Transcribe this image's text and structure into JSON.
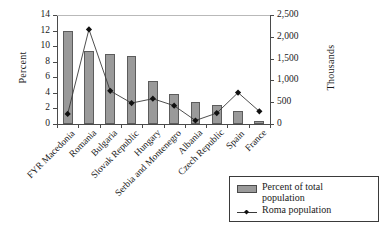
{
  "chart_data": {
    "type": "bar",
    "title": "",
    "xlabel": "",
    "ylabel": "Percent",
    "y2label": "Thousands",
    "ylim": [
      0,
      14
    ],
    "y2lim": [
      0,
      2500
    ],
    "grid": false,
    "legend_position": "bottom-right",
    "categories": [
      "FYR Macedonia",
      "Romania",
      "Bulgaria",
      "Slovak Republic",
      "Hungary",
      "Serbia and Montenegro",
      "Albania",
      "Czech Republic",
      "Spain",
      "France"
    ],
    "yticks": [
      "0",
      "2",
      "4",
      "6",
      "8",
      "10",
      "12",
      "14"
    ],
    "y2ticks": [
      "0",
      "500",
      "1,000",
      "1,500",
      "2,000",
      "2,500"
    ],
    "series": [
      {
        "name": "Percent of total population",
        "type": "bar",
        "axis": "left",
        "unit": "percent",
        "color": "#9a9a9a",
        "values": [
          12.0,
          9.4,
          9.0,
          8.8,
          5.5,
          3.9,
          2.8,
          2.5,
          1.65,
          0.35
        ]
      },
      {
        "name": "Roma population",
        "type": "line",
        "axis": "right",
        "unit": "thousands",
        "color": "#3a3a3a",
        "marker": "diamond",
        "values": [
          230,
          2170,
          760,
          480,
          580,
          420,
          80,
          250,
          720,
          290
        ]
      }
    ]
  },
  "legend": {
    "items": [
      {
        "label_line1": "Percent of total",
        "label_line2": "population",
        "marker": "bar-swatch"
      },
      {
        "label_line1": "Roma population",
        "label_line2": "",
        "marker": "line-diamond"
      }
    ]
  }
}
